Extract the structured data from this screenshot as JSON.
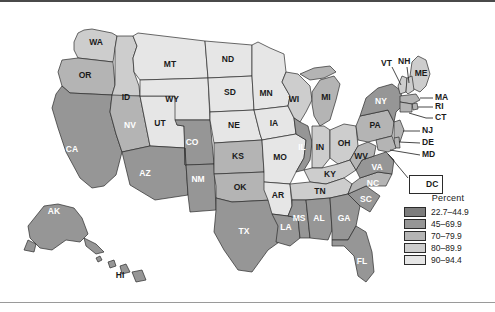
{
  "figure": {
    "kind": "choropleth-map",
    "region": "United States"
  },
  "legend": {
    "title": "Percent",
    "rows": [
      {
        "label": "22.7–44.9",
        "color": "#7d7d7d"
      },
      {
        "label": "45–69.9",
        "color": "#969696"
      },
      {
        "label": "70–79.9",
        "color": "#b4b4b4"
      },
      {
        "label": "80–89.9",
        "color": "#cdcdcd"
      },
      {
        "label": "90–94.4",
        "color": "#e6e6e6"
      }
    ]
  },
  "inset": {
    "dc_label": "DC",
    "dc_color": "#7d7d7d"
  },
  "chart_data": {
    "type": "map",
    "title": "Percent",
    "legend_position": "right",
    "bins": [
      "22.7–44.9",
      "45–69.9",
      "70–79.9",
      "80–89.9",
      "90–94.4"
    ],
    "bin_colors": [
      "#7d7d7d",
      "#969696",
      "#b4b4b4",
      "#cdcdcd",
      "#e6e6e6"
    ],
    "states": [
      {
        "code": "WA",
        "bin": 3,
        "color": "#cdcdcd"
      },
      {
        "code": "OR",
        "bin": 2,
        "color": "#b4b4b4"
      },
      {
        "code": "CA",
        "bin": 1,
        "color": "#969696"
      },
      {
        "code": "NV",
        "bin": 2,
        "color": "#b4b4b4"
      },
      {
        "code": "ID",
        "bin": 3,
        "color": "#cdcdcd"
      },
      {
        "code": "MT",
        "bin": 4,
        "color": "#e6e6e6"
      },
      {
        "code": "WY",
        "bin": 4,
        "color": "#e6e6e6"
      },
      {
        "code": "UT",
        "bin": 4,
        "color": "#e6e6e6"
      },
      {
        "code": "AZ",
        "bin": 1,
        "color": "#969696"
      },
      {
        "code": "CO",
        "bin": 1,
        "color": "#969696"
      },
      {
        "code": "NM",
        "bin": 1,
        "color": "#969696"
      },
      {
        "code": "ND",
        "bin": 4,
        "color": "#e6e6e6"
      },
      {
        "code": "SD",
        "bin": 4,
        "color": "#e6e6e6"
      },
      {
        "code": "NE",
        "bin": 4,
        "color": "#e6e6e6"
      },
      {
        "code": "KS",
        "bin": 2,
        "color": "#b4b4b4"
      },
      {
        "code": "OK",
        "bin": 2,
        "color": "#b4b4b4"
      },
      {
        "code": "TX",
        "bin": 1,
        "color": "#969696"
      },
      {
        "code": "MN",
        "bin": 4,
        "color": "#e6e6e6"
      },
      {
        "code": "IA",
        "bin": 4,
        "color": "#e6e6e6"
      },
      {
        "code": "MO",
        "bin": 4,
        "color": "#e6e6e6"
      },
      {
        "code": "AR",
        "bin": 4,
        "color": "#e6e6e6"
      },
      {
        "code": "LA",
        "bin": 1,
        "color": "#969696"
      },
      {
        "code": "WI",
        "bin": 3,
        "color": "#cdcdcd"
      },
      {
        "code": "IL",
        "bin": 1,
        "color": "#969696"
      },
      {
        "code": "MI",
        "bin": 2,
        "color": "#b4b4b4"
      },
      {
        "code": "IN",
        "bin": 3,
        "color": "#cdcdcd"
      },
      {
        "code": "OH",
        "bin": 3,
        "color": "#cdcdcd"
      },
      {
        "code": "KY",
        "bin": 3,
        "color": "#cdcdcd"
      },
      {
        "code": "TN",
        "bin": 3,
        "color": "#cdcdcd"
      },
      {
        "code": "MS",
        "bin": 1,
        "color": "#969696"
      },
      {
        "code": "AL",
        "bin": 1,
        "color": "#969696"
      },
      {
        "code": "GA",
        "bin": 1,
        "color": "#969696"
      },
      {
        "code": "FL",
        "bin": 1,
        "color": "#969696"
      },
      {
        "code": "SC",
        "bin": 1,
        "color": "#969696"
      },
      {
        "code": "NC",
        "bin": 2,
        "color": "#b4b4b4"
      },
      {
        "code": "VA",
        "bin": 1,
        "color": "#969696"
      },
      {
        "code": "WV",
        "bin": 2,
        "color": "#b4b4b4"
      },
      {
        "code": "PA",
        "bin": 2,
        "color": "#b4b4b4"
      },
      {
        "code": "NY",
        "bin": 1,
        "color": "#969696"
      },
      {
        "code": "ME",
        "bin": 3,
        "color": "#cdcdcd"
      },
      {
        "code": "VT",
        "bin": 3,
        "color": "#cdcdcd"
      },
      {
        "code": "NH",
        "bin": 3,
        "color": "#cdcdcd"
      },
      {
        "code": "MA",
        "bin": 2,
        "color": "#b4b4b4"
      },
      {
        "code": "RI",
        "bin": 2,
        "color": "#b4b4b4"
      },
      {
        "code": "CT",
        "bin": 2,
        "color": "#b4b4b4"
      },
      {
        "code": "NJ",
        "bin": 2,
        "color": "#b4b4b4"
      },
      {
        "code": "DE",
        "bin": 2,
        "color": "#b4b4b4"
      },
      {
        "code": "MD",
        "bin": 2,
        "color": "#b4b4b4"
      },
      {
        "code": "DC",
        "bin": 1,
        "color": "#7d7d7d"
      },
      {
        "code": "AK",
        "bin": 1,
        "color": "#969696"
      },
      {
        "code": "HI",
        "bin": 1,
        "color": "#969696"
      }
    ],
    "leader_labels": [
      "VT",
      "NH",
      "ME",
      "MA",
      "RI",
      "CT",
      "NJ",
      "DE",
      "MD",
      "DC"
    ]
  }
}
